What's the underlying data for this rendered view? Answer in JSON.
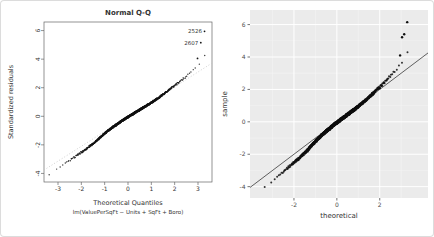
{
  "frame": {
    "background": "#ffffff",
    "border_color": "#dcdcdc"
  },
  "chart_data": [
    {
      "type": "scatter",
      "variant": "qq-base-r",
      "title": "Normal Q-Q",
      "xlabel": "Theoretical Quantiles",
      "xlabel_sub": "lm(ValuePerSqFt ~ Units + SqFt + Boro)",
      "ylabel": "Standardized residuals",
      "xlim": [
        -3.6,
        3.6
      ],
      "ylim": [
        -4.6,
        6.6
      ],
      "xticks": [
        -3,
        -2,
        -1,
        0,
        1,
        2,
        3
      ],
      "yticks": [
        -4,
        -2,
        0,
        2,
        4,
        6
      ],
      "grid": false,
      "legend": false,
      "point_color": "#141414",
      "axis_color": "#666666",
      "text_color": "#333333",
      "reference_line": {
        "style": "dotted",
        "color": "#c4c4c4",
        "slope": 1.04,
        "intercept": -0.02
      },
      "qq_curve": [
        [
          -3.4,
          -4.1
        ],
        [
          -3.0,
          -3.65
        ],
        [
          -2.6,
          -3.2
        ],
        [
          -2.2,
          -2.75
        ],
        [
          -1.8,
          -2.3
        ],
        [
          -1.4,
          -1.8
        ],
        [
          -1.0,
          -1.2
        ],
        [
          -0.6,
          -0.7
        ],
        [
          -0.2,
          -0.25
        ],
        [
          0.2,
          0.15
        ],
        [
          0.6,
          0.55
        ],
        [
          1.0,
          0.95
        ],
        [
          1.4,
          1.4
        ],
        [
          1.8,
          1.9
        ],
        [
          2.2,
          2.4
        ],
        [
          2.6,
          2.95
        ],
        [
          2.9,
          3.45
        ],
        [
          3.05,
          3.7
        ],
        [
          3.15,
          3.95
        ]
      ],
      "outliers": [
        [
          2.98,
          4.05
        ],
        [
          3.12,
          5.15
        ],
        [
          3.28,
          5.95
        ]
      ],
      "labeled_points": [
        {
          "label": "2526",
          "x": 3.28,
          "y": 5.95
        },
        {
          "label": "2607",
          "x": 3.12,
          "y": 5.15
        }
      ]
    },
    {
      "type": "scatter",
      "variant": "qq-ggplot",
      "title": "",
      "xlabel": "theoretical",
      "ylabel": "sample",
      "xlim": [
        -4.05,
        4.25
      ],
      "ylim": [
        -4.7,
        6.9
      ],
      "xticks": [
        -2,
        0,
        2
      ],
      "yticks": [
        -4,
        -2,
        0,
        2,
        4,
        6
      ],
      "xticks_minor": [
        -3,
        -1,
        1,
        3
      ],
      "yticks_minor": [
        -3,
        -1,
        1,
        3,
        5
      ],
      "grid": true,
      "legend": false,
      "panel_background": "#ebebeb",
      "grid_major_color": "#ffffff",
      "grid_minor_color": "#f4f4f4",
      "point_color": "#111111",
      "tick_color": "#333333",
      "tick_label_color": "#4d4d4d",
      "axis_title_color": "#333333",
      "abline": {
        "slope": 1,
        "intercept": 0,
        "color": "#3a3a3a"
      },
      "qq_curve": [
        [
          -3.4,
          -4.1
        ],
        [
          -3.0,
          -3.65
        ],
        [
          -2.6,
          -3.2
        ],
        [
          -2.2,
          -2.75
        ],
        [
          -1.8,
          -2.3
        ],
        [
          -1.4,
          -1.8
        ],
        [
          -1.0,
          -1.2
        ],
        [
          -0.6,
          -0.7
        ],
        [
          -0.2,
          -0.25
        ],
        [
          0.2,
          0.15
        ],
        [
          0.6,
          0.55
        ],
        [
          1.0,
          0.95
        ],
        [
          1.4,
          1.4
        ],
        [
          1.8,
          1.9
        ],
        [
          2.2,
          2.4
        ],
        [
          2.6,
          2.95
        ],
        [
          2.9,
          3.45
        ],
        [
          3.05,
          3.7
        ],
        [
          3.15,
          3.95
        ]
      ],
      "outliers": [
        [
          2.95,
          4.1
        ],
        [
          3.04,
          5.22
        ],
        [
          3.14,
          5.4
        ],
        [
          3.28,
          6.15
        ]
      ]
    }
  ]
}
